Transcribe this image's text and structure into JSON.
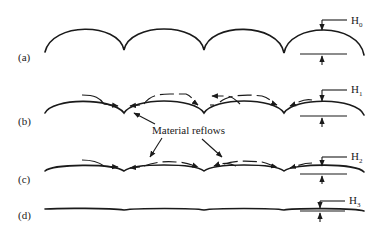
{
  "figure": {
    "stages": [
      {
        "id": "a",
        "label": "(a)",
        "height_label": "H",
        "height_sub": "0",
        "reflow_arrows": false
      },
      {
        "id": "b",
        "label": "(b)",
        "height_label": "H",
        "height_sub": "1",
        "reflow_arrows": true
      },
      {
        "id": "c",
        "label": "(c)",
        "height_label": "H",
        "height_sub": "2",
        "reflow_arrows": true
      },
      {
        "id": "d",
        "label": "(d)",
        "height_label": "H",
        "height_sub": "3",
        "reflow_arrows": false
      }
    ],
    "annotation": "Material reflows",
    "color": "#1a1a1a"
  }
}
